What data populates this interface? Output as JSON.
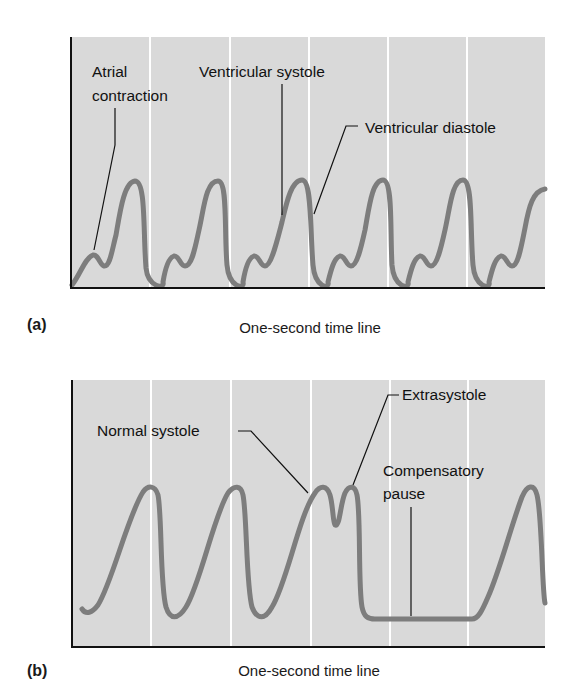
{
  "figure": {
    "panels": [
      {
        "letter": "(a)",
        "axis_caption": "One-second time line",
        "annotations": {
          "atrial_line1": "Atrial",
          "atrial_line2": "contraction",
          "ventricular_systole": "Ventricular systole",
          "ventricular_diastole": "Ventricular diastole"
        }
      },
      {
        "letter": "(b)",
        "axis_caption": "One-second time line",
        "annotations": {
          "normal_systole": "Normal systole",
          "extrasystole": "Extrasystole",
          "compensatory_line1": "Compensatory",
          "compensatory_line2": "pause"
        }
      }
    ]
  },
  "colors": {
    "plot_background": "#d9d9d9",
    "gridline": "#ffffff",
    "trace": "#7d7d7d",
    "axis": "#111111",
    "leader_line": "#111111"
  }
}
